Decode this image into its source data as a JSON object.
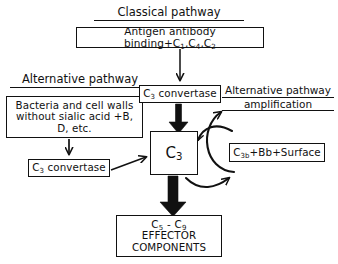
{
  "diagram": {
    "headings": {
      "classical": "Classical pathway",
      "alternative": "Alternative pathway",
      "amplification_line1": "Alternative pathway",
      "amplification_line2": "amplification"
    },
    "nodes": {
      "antigen": {
        "text_prefix": "Antigen antibody binding+C",
        "sub1": "1",
        "sep1": ",C",
        "sub2": "4",
        "sep2": ",C",
        "sub3": "2"
      },
      "bacteria": {
        "line1": "Bacteria and cell walls",
        "line2": "without sialic acid +B,",
        "line3": "D, etc."
      },
      "convertase_top": {
        "symbol": "C",
        "sub": "3",
        "label": " convertase"
      },
      "convertase_left": {
        "symbol": "C",
        "sub": "3",
        "label": " convertase"
      },
      "c3": {
        "symbol": "C",
        "sub": "3"
      },
      "c3bbb": {
        "symbol": "C",
        "sub": "3b",
        "label": "+Bb+Surface"
      },
      "effector": {
        "line1_a": "C",
        "line1_sub_a": "5",
        "line1_mid": " - C",
        "line1_sub_b": "9",
        "line2": "EFFECTOR",
        "line3": "COMPONENTS"
      }
    },
    "colors": {
      "stroke": "#111111",
      "background": "#ffffff"
    }
  }
}
